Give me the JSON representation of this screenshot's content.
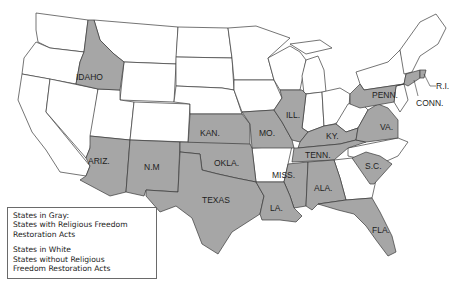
{
  "map": {
    "title": "United States — Religious Freedom Restoration Acts",
    "colors": {
      "gray_fill": "#a6a6a6",
      "white_fill": "#ffffff",
      "border": "#3a3a3a"
    },
    "labels": {
      "idaho": "IDAHO",
      "kansas": "KAN.",
      "missouri": "MO.",
      "illinois": "ILL.",
      "kentucky": "KY.",
      "pennsylvania": "PENN.",
      "virginia": "VA.",
      "tennessee": "TENN.",
      "south_carolina": "S.C.",
      "arizona": "ARIZ.",
      "new_mexico": "N.M",
      "oklahoma": "OKLA.",
      "texas": "TEXAS",
      "mississippi": "MISS.",
      "alabama": "ALA.",
      "louisiana": "LA.",
      "florida": "FLA.",
      "rhode_island": "R.I.",
      "connecticut": "CONN."
    },
    "gray_states": [
      "Idaho",
      "Kansas",
      "Missouri",
      "Illinois",
      "Kentucky",
      "Pennsylvania",
      "Virginia",
      "Tennessee",
      "South Carolina",
      "Arizona",
      "New Mexico",
      "Oklahoma",
      "Texas",
      "Mississippi",
      "Alabama",
      "Louisiana",
      "Florida",
      "Rhode Island",
      "Connecticut"
    ]
  },
  "legend": {
    "gray_heading": "States in Gray:",
    "gray_line1": "States with Religious Freedom",
    "gray_line2": "Restoration Acts",
    "white_heading": "States in White",
    "white_line1": "States without Religious",
    "white_line2": "Freedom Restoration Acts"
  }
}
